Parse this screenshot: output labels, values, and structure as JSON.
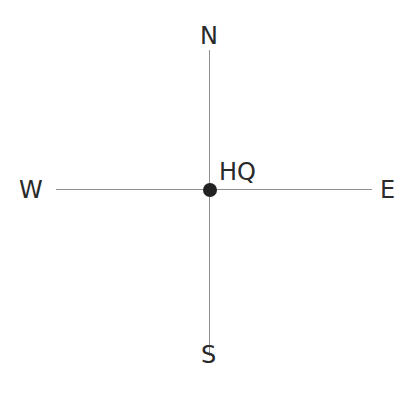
{
  "diagram": {
    "type": "compass",
    "directions": {
      "north": "N",
      "south": "S",
      "east": "E",
      "west": "W"
    },
    "center": {
      "label": "HQ",
      "marker": "filled-circle"
    },
    "colors": {
      "lines": "#8f8f8f",
      "text": "#2a2a2a",
      "marker": "#222222",
      "background": "#ffffff"
    }
  }
}
